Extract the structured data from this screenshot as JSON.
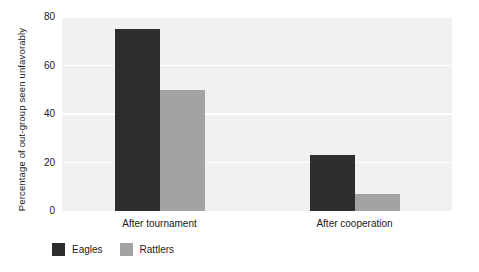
{
  "chart_data": {
    "type": "bar",
    "title": "",
    "subtitle": "",
    "xlabel": "",
    "ylabel": "Percentage of out-group seen unfavorably",
    "categories": [
      "After tournament",
      "After cooperation"
    ],
    "series": [
      {
        "name": "Eagles",
        "values": [
          75,
          23
        ],
        "color": "#2d2d2d"
      },
      {
        "name": "Rattlers",
        "values": [
          50,
          7
        ],
        "color": "#a3a3a3"
      }
    ],
    "ylim": [
      0,
      80
    ],
    "yticks": [
      0,
      20,
      40,
      60,
      80
    ],
    "ytick_labels": [
      "0",
      "20",
      "40",
      "60",
      "80"
    ],
    "grid": true,
    "grid_color": "#ffffff",
    "plot_background": "#f1f1f1",
    "figure_background": "#ffffff",
    "legend_position": "bottom-left",
    "legend": [
      {
        "label": "Eagles",
        "color": "#2d2d2d"
      },
      {
        "label": "Rattlers",
        "color": "#a3a3a3"
      }
    ]
  }
}
